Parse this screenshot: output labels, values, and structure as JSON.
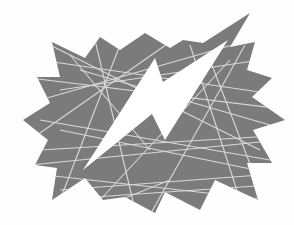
{
  "graphic": {
    "alt": "Gray jagged starburst crossed by thin light lines, with a white lightning bolt through the center",
    "colors": {
      "background": "#fefefe",
      "burst_fill": "#7b7b7b",
      "line_color": "#d9d9d9",
      "bolt_fill": "#ffffff"
    },
    "icons": [
      "starburst-icon",
      "lightning-bolt-icon"
    ]
  }
}
